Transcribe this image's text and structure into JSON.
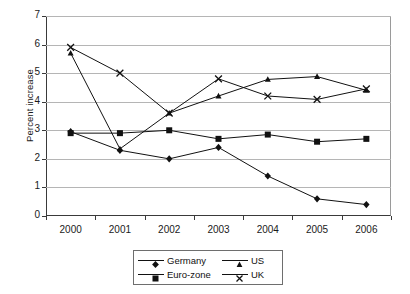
{
  "chart_data": {
    "type": "line",
    "title": "",
    "xlabel": "",
    "ylabel": "Percent increase",
    "categories": [
      "2000",
      "2001",
      "2002",
      "2003",
      "2004",
      "2005",
      "2006"
    ],
    "x": [
      2000,
      2001,
      2002,
      2003,
      2004,
      2005,
      2006
    ],
    "ylim": [
      0,
      7
    ],
    "yticks": [
      0,
      1,
      2,
      3,
      4,
      5,
      6,
      7
    ],
    "ytick_labels": [
      "0",
      "1",
      "2",
      "3",
      "4",
      "5",
      "6",
      "7"
    ],
    "grid": "horizontal",
    "legend_position": "bottom-center",
    "series": [
      {
        "name": "Germany",
        "marker": "diamond",
        "color": "#111111",
        "values": [
          2.95,
          2.3,
          2.0,
          2.4,
          1.4,
          0.6,
          0.4
        ]
      },
      {
        "name": "Euro-zone",
        "marker": "square",
        "color": "#111111",
        "values": [
          2.9,
          2.9,
          3.0,
          2.7,
          2.85,
          2.6,
          2.7
        ]
      },
      {
        "name": "US",
        "marker": "triangle",
        "color": "#111111",
        "values": [
          5.7,
          2.35,
          3.6,
          4.2,
          4.78,
          4.88,
          4.4
        ]
      },
      {
        "name": "UK",
        "marker": "cross",
        "color": "#111111",
        "values": [
          5.9,
          5.0,
          3.6,
          4.8,
          4.2,
          4.08,
          4.45
        ]
      }
    ]
  },
  "legend": {
    "entries": [
      {
        "label": "Germany",
        "marker": "diamond-marker"
      },
      {
        "label": "US",
        "marker": "triangle-marker"
      },
      {
        "label": "Euro-zone",
        "marker": "square-marker"
      },
      {
        "label": "UK",
        "marker": "cross-marker"
      }
    ]
  }
}
